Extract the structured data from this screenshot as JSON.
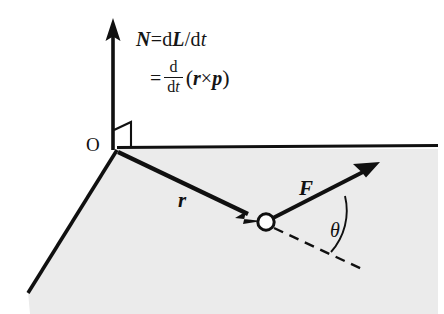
{
  "figure": {
    "background_color": "#ffffff",
    "stroke_color": "#101010",
    "plane_fill_color": "#ebebeb"
  },
  "equations": {
    "line1": {
      "lhs": "N",
      "equals": "=",
      "d1": "d",
      "numerator_vector": "L",
      "slash": "/",
      "d2": "d",
      "denominator_var": "t"
    },
    "line2": {
      "equals": "=",
      "frac_numerator": "d",
      "frac_denominator_d": "d",
      "frac_denominator_t": "t",
      "open_paren": "(",
      "vector_r": "r",
      "cross": "×",
      "vector_p": "p",
      "close_paren": ")"
    }
  },
  "labels": {
    "origin": "O",
    "position_vector": "r",
    "force_vector": "F",
    "angle": "θ"
  },
  "elements": {
    "axis_vertical_name": "torque-axis-arrow",
    "axis_horizontal_name": "plane-edge-horizontal",
    "axis_diagonal_name": "plane-edge-diagonal",
    "right_angle_marker": "right-angle-marker",
    "particle": "particle-point",
    "dashed_reference": "dashed-reference-line",
    "angle_arc": "angle-arc"
  }
}
